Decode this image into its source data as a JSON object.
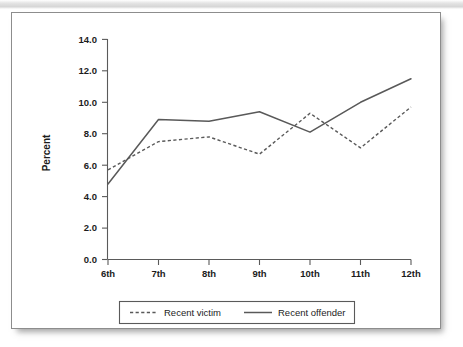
{
  "chart_data": {
    "type": "line",
    "title": "",
    "xlabel": "",
    "ylabel": "Percent",
    "categories": [
      "6th",
      "7th",
      "8th",
      "9th",
      "10th",
      "11th",
      "12th"
    ],
    "series": [
      {
        "name": "Recent victim",
        "style": "dashed",
        "values": [
          5.7,
          7.5,
          7.8,
          6.7,
          9.3,
          7.1,
          9.7
        ]
      },
      {
        "name": "Recent offender",
        "style": "solid",
        "values": [
          4.8,
          8.9,
          8.8,
          9.4,
          8.1,
          10.0,
          11.5
        ]
      }
    ],
    "ylim": [
      0.0,
      14.0
    ],
    "ytick_step": 2.0,
    "ytick_labels": [
      "0.0",
      "2.0",
      "4.0",
      "6.0",
      "8.0",
      "10.0",
      "12.0",
      "14.0"
    ],
    "grid": false,
    "legend_position": "bottom"
  },
  "legend": {
    "entries": [
      {
        "label": "Recent victim",
        "style": "dashed"
      },
      {
        "label": "Recent offender",
        "style": "solid"
      }
    ]
  },
  "colors": {
    "line": "#595959",
    "axis": "#5a5a5a",
    "text": "#1c1c1c",
    "card_background": "#ffffff",
    "card_border": "#8d8d8d",
    "page_background": "#ffffff"
  }
}
